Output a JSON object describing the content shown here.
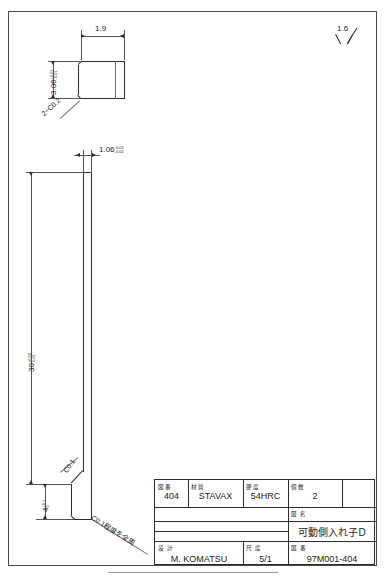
{
  "drawing": {
    "sheet_title": "Mechanical part detail drawing",
    "surface_finish": {
      "symbol": "triangle-roughness",
      "value": "1.6"
    },
    "top_view": {
      "name": "end-view",
      "width_dim": "1.9",
      "height_dim": "3.06",
      "height_tol_upper": "+0.01",
      "height_tol_lower": "-0.01",
      "chamfer_note": "2−C0.2"
    },
    "main_view": {
      "name": "front-view",
      "thickness_dim": "1.06",
      "thickness_tol_upper": "-0.01",
      "thickness_tol_lower": "-0.02",
      "length_dim": "30",
      "length_tol_upper": "+0.02",
      "length_tol_lower": "-0.01",
      "foot_dim": "4",
      "foot_tol_upper": "+0.1",
      "foot_tol_lower": "0",
      "chamfer_callout": "C0.1",
      "all_around_note": "C0.1程度を全周"
    }
  },
  "title_block": {
    "row1": [
      {
        "label": "図番",
        "value": "404"
      },
      {
        "label": "材質",
        "value": "STAVAX"
      },
      {
        "label": "硬度",
        "value": "54HRC"
      },
      {
        "label": "個数",
        "value": "2"
      },
      {
        "label": "",
        "value": ""
      }
    ],
    "drawing_name": {
      "label": "図  名",
      "value": "可動側入れ子D"
    },
    "design": {
      "label": "設  計",
      "value": "M. KOMATSU"
    },
    "scale": {
      "label": "尺  度",
      "value": "5/1"
    },
    "drawing_no": {
      "label": "図  番",
      "value": "97M001-404"
    }
  },
  "caption": {
    "text": ""
  }
}
